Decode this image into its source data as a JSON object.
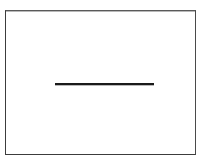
{
  "figure": {
    "title": "Horizontal line segment inside rectangular frame",
    "canvas": {
      "width": 208,
      "height": 164,
      "background_color": "#ffffff"
    },
    "frame": {
      "name": "rectangle-border",
      "x": 5,
      "y": 10,
      "width": 191,
      "height": 145,
      "stroke_color": "#3c3c3c",
      "stroke_width": 1,
      "fill_color": "#ffffff"
    },
    "shapes": [
      {
        "name": "horizontal-line",
        "type": "line",
        "x1": 54,
        "y1": 83,
        "x2": 153,
        "y2": 83,
        "length": 99,
        "thickness": 2,
        "color": "#1a1a1a",
        "orientation": "horizontal"
      }
    ],
    "labels": [],
    "annotations": []
  }
}
